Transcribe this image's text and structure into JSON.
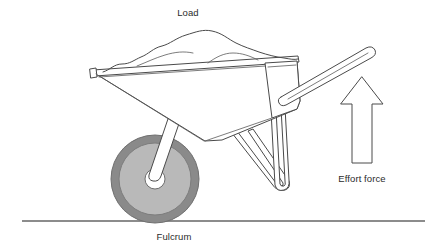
{
  "figure": {
    "background_color": "#ffffff",
    "width": 441,
    "height": 252
  },
  "labels": {
    "load": "Load",
    "effort_force": "Effort force",
    "fulcrum": "Fulcrum"
  },
  "colors": {
    "outline": "#4a4a4a",
    "outline_light": "#5a5a5a",
    "text": "#2b2b2b",
    "ground_line": "#8c8c8c",
    "tire": "#8a8a8a",
    "rim": "#b9b9b9",
    "hub": "#ffffff",
    "fill_white": "#ffffff"
  },
  "parts": [
    {
      "name": "load-pile",
      "label": "Load",
      "description": "heaped mound of material in the tray"
    },
    {
      "name": "tray",
      "label": "",
      "description": "wheelbarrow bucket / tray"
    },
    {
      "name": "handle",
      "label": "",
      "description": "rear handle bar angled up to the right"
    },
    {
      "name": "wheel",
      "label": "",
      "description": "front wheel acting as the fulcrum"
    },
    {
      "name": "support-leg",
      "label": "",
      "description": "U-shaped rear support leg"
    },
    {
      "name": "axle-strut",
      "label": "",
      "description": "strut from tray down to wheel hub"
    },
    {
      "name": "effort-arrow",
      "label": "Effort force",
      "description": "outlined arrow pointing up"
    },
    {
      "name": "ground-line",
      "label": "Fulcrum",
      "description": "horizontal ground reference line"
    }
  ],
  "annotations": [
    {
      "name": "load-annotation",
      "text": "Load",
      "points_to": "load-pile",
      "position": "top-center"
    },
    {
      "name": "effort-force-annotation",
      "text": "Effort force",
      "points_to": "effort-arrow",
      "position": "right"
    },
    {
      "name": "fulcrum-annotation",
      "text": "Fulcrum",
      "points_to": "wheel",
      "position": "bottom-center"
    }
  ],
  "arrow": {
    "direction": "up",
    "style": "outline",
    "tip_y": 77,
    "base_y": 163
  }
}
